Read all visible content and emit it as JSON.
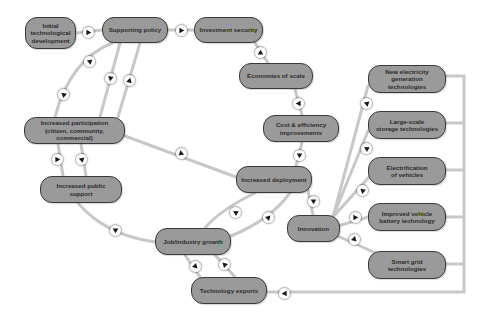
{
  "diagram": {
    "line_color": "#c8c8c8",
    "node_fill": "#9a9a9a",
    "node_border": "#3a3a3a",
    "arrow_color": "#1a1a1a",
    "nodes": [
      {
        "id": "initial",
        "label": "Initial\ntechnological\ndevelopment",
        "x": 25,
        "y": 17,
        "w": 51,
        "h": 32
      },
      {
        "id": "policy",
        "label": "Supporting policy",
        "x": 102,
        "y": 17,
        "w": 66,
        "h": 26
      },
      {
        "id": "investment",
        "label": "Investment security",
        "x": 194,
        "y": 17,
        "w": 69,
        "h": 26
      },
      {
        "id": "economies",
        "label": "Economies of scale",
        "x": 239,
        "y": 63,
        "w": 74,
        "h": 26
      },
      {
        "id": "cost",
        "label": "Cost & efficiency\nimprovements",
        "x": 263,
        "y": 115,
        "w": 76,
        "h": 27
      },
      {
        "id": "participation",
        "label": "Increased participation\n(citizen, community, commercial)",
        "x": 24,
        "y": 117,
        "w": 101,
        "h": 27
      },
      {
        "id": "public",
        "label": "Increased public support",
        "x": 40,
        "y": 176,
        "w": 82,
        "h": 27
      },
      {
        "id": "deployment",
        "label": "Increased deployment",
        "x": 236,
        "y": 166,
        "w": 76,
        "h": 27
      },
      {
        "id": "innovation",
        "label": "Innovation",
        "x": 287,
        "y": 215,
        "w": 53,
        "h": 27
      },
      {
        "id": "jobs",
        "label": "Job/industry growth",
        "x": 155,
        "y": 228,
        "w": 76,
        "h": 27
      },
      {
        "id": "exports",
        "label": "Technology exports",
        "x": 191,
        "y": 277,
        "w": 76,
        "h": 27
      },
      {
        "id": "newgen",
        "label": "New electricity\ngeneration technologies",
        "x": 368,
        "y": 65,
        "w": 78,
        "h": 28
      },
      {
        "id": "storage",
        "label": "Large-scale\nstorage technologies",
        "x": 368,
        "y": 111,
        "w": 78,
        "h": 28
      },
      {
        "id": "ev",
        "label": "Electrification\nof vehicles",
        "x": 368,
        "y": 157,
        "w": 78,
        "h": 28
      },
      {
        "id": "battery",
        "label": "Improved vehicle\nbattery technology",
        "x": 368,
        "y": 203,
        "w": 78,
        "h": 28
      },
      {
        "id": "smartgrid",
        "label": "Smart grid\ntechnologies",
        "x": 368,
        "y": 251,
        "w": 78,
        "h": 28
      }
    ],
    "edges": [
      {
        "from": "initial",
        "to": "policy",
        "path": "M76 33 L102 30"
      },
      {
        "from": "policy",
        "to": "investment",
        "path": "M168 30 L194 30"
      },
      {
        "from": "investment",
        "to": "economies",
        "path": "M255 43 L268 63"
      },
      {
        "from": "economies",
        "to": "cost",
        "path": "M295 89 L302 115"
      },
      {
        "from": "cost",
        "to": "deployment",
        "path": "M302 142 L296 166"
      },
      {
        "from": "deployment",
        "to": "innovation",
        "path": "M307 186 L313 215"
      },
      {
        "from": "policy",
        "to": "participation",
        "path": "M112 43 Q70 60 55 117"
      },
      {
        "from": "policy",
        "to": "participation",
        "path": "M120 43 L100 117"
      },
      {
        "from": "participation",
        "to": "policy",
        "path": "M118 117 L140 43"
      },
      {
        "from": "participation",
        "to": "public",
        "path": "M58 144 L63 176"
      },
      {
        "from": "public",
        "to": "participation",
        "path": "M86 176 L81 144"
      },
      {
        "from": "participation",
        "to": "deployment",
        "path": "M125 136 L236 177"
      },
      {
        "from": "public",
        "to": "jobs",
        "path": "M78 203 Q105 235 155 242"
      },
      {
        "from": "deployment",
        "to": "jobs",
        "path": "M255 193 Q220 210 205 228"
      },
      {
        "from": "jobs",
        "to": "deployment",
        "path": "M231 236 Q270 220 290 193"
      },
      {
        "from": "jobs",
        "to": "exports",
        "path": "M185 255 L200 277"
      },
      {
        "from": "exports",
        "to": "jobs",
        "path": "M235 277 L215 255"
      },
      {
        "from": "innovation",
        "to": "newgen",
        "path": "M333 217 L368 86"
      },
      {
        "from": "innovation",
        "to": "storage",
        "path": "M333 217 L368 131"
      },
      {
        "from": "innovation",
        "to": "ev",
        "path": "M333 217 L370 176"
      },
      {
        "from": "innovation",
        "to": "battery",
        "path": "M338 226 L368 217"
      },
      {
        "from": "innovation",
        "to": "smartgrid",
        "path": "M333 234 L378 254"
      },
      {
        "from": "techs",
        "to": "exports",
        "path": "M446 76 L464 76 L464 292 L267 292 M446 123 L464 123 M446 170 L464 170 M446 217 L464 217 M446 264 L464 264"
      }
    ],
    "arrows": [
      {
        "name": "arrow-initial-to-policy",
        "x": 88,
        "y": 32,
        "dir": 0
      },
      {
        "name": "arrow-policy-to-investment",
        "x": 181,
        "y": 30,
        "dir": 0
      },
      {
        "name": "arrow-investment-to-economies",
        "x": 260,
        "y": 52,
        "dir": 270
      },
      {
        "name": "arrow-economies-to-cost",
        "x": 298,
        "y": 103,
        "dir": 180
      },
      {
        "name": "arrow-cost-to-deployment",
        "x": 299,
        "y": 155,
        "dir": 90
      },
      {
        "name": "arrow-deployment-to-innovation",
        "x": 313,
        "y": 201,
        "dir": 90
      },
      {
        "name": "arrow-policy-participation-outer-1",
        "x": 89,
        "y": 61,
        "dir": 200
      },
      {
        "name": "arrow-policy-participation-outer-2",
        "x": 63,
        "y": 94,
        "dir": 220
      },
      {
        "name": "arrow-policy-to-participation-mid",
        "x": 110,
        "y": 78,
        "dir": 100
      },
      {
        "name": "arrow-participation-to-policy",
        "x": 129,
        "y": 80,
        "dir": 285
      },
      {
        "name": "arrow-participation-to-public",
        "x": 57,
        "y": 159,
        "dir": 0
      },
      {
        "name": "arrow-public-to-participation",
        "x": 81,
        "y": 159,
        "dir": 200
      },
      {
        "name": "arrow-participation-to-deployment",
        "x": 181,
        "y": 153,
        "dir": 20
      },
      {
        "name": "arrow-public-to-jobs",
        "x": 115,
        "y": 230,
        "dir": 90
      },
      {
        "name": "arrow-deployment-to-jobs",
        "x": 235,
        "y": 212,
        "dir": 210
      },
      {
        "name": "arrow-jobs-to-deployment",
        "x": 268,
        "y": 217,
        "dir": 315
      },
      {
        "name": "arrow-jobs-to-exports",
        "x": 195,
        "y": 266,
        "dir": 45
      },
      {
        "name": "arrow-exports-to-jobs",
        "x": 224,
        "y": 264,
        "dir": 225
      },
      {
        "name": "arrow-innovation-to-newgen",
        "x": 366,
        "y": 103,
        "dir": 200
      },
      {
        "name": "arrow-innovation-to-storage",
        "x": 366,
        "y": 148,
        "dir": 210
      },
      {
        "name": "arrow-innovation-to-ev",
        "x": 362,
        "y": 190,
        "dir": 220
      },
      {
        "name": "arrow-innovation-to-battery",
        "x": 355,
        "y": 217,
        "dir": 0
      },
      {
        "name": "arrow-innovation-to-smartgrid",
        "x": 354,
        "y": 239,
        "dir": 45
      },
      {
        "name": "arrow-techs-to-exports",
        "x": 284,
        "y": 293,
        "dir": 180
      }
    ]
  }
}
